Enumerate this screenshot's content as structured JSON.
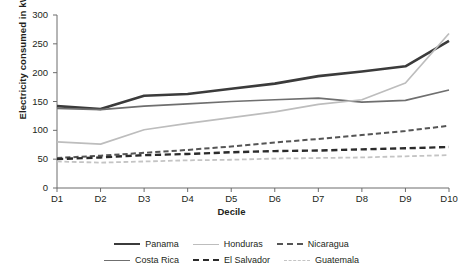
{
  "chart_data": {
    "type": "line",
    "title": "",
    "xlabel": "Decile",
    "ylabel": "Electricity consumed in kWh",
    "categories": [
      "D1",
      "D2",
      "D3",
      "D4",
      "D5",
      "D6",
      "D7",
      "D8",
      "D9",
      "D10"
    ],
    "ylim": [
      0,
      300
    ],
    "yticks": [
      0,
      50,
      100,
      150,
      200,
      250,
      300
    ],
    "grid": false,
    "legend_position": "bottom",
    "series": [
      {
        "name": "Panama",
        "color": "#3b3b3b",
        "style": "solid",
        "width": 2.6,
        "values": [
          142,
          137,
          160,
          163,
          172,
          181,
          194,
          202,
          211,
          255
        ]
      },
      {
        "name": "Costa Rica",
        "color": "#6f6f6f",
        "style": "solid",
        "width": 1.7,
        "values": [
          138,
          136,
          142,
          146,
          150,
          153,
          156,
          149,
          152,
          170
        ]
      },
      {
        "name": "Honduras",
        "color": "#bdbdbd",
        "style": "solid",
        "width": 1.7,
        "values": [
          80,
          76,
          101,
          112,
          122,
          132,
          145,
          153,
          182,
          268
        ]
      },
      {
        "name": "Nicaragua",
        "color": "#555555",
        "style": "dashed",
        "width": 2.0,
        "values": [
          52,
          56,
          61,
          66,
          72,
          79,
          85,
          92,
          99,
          108
        ]
      },
      {
        "name": "El Salvador",
        "color": "#2b2b2b",
        "style": "dashed",
        "width": 2.4,
        "values": [
          50,
          53,
          57,
          59,
          62,
          64,
          65,
          67,
          69,
          71
        ]
      },
      {
        "name": "Guatemala",
        "color": "#c4c4c4",
        "style": "dashed",
        "width": 1.8,
        "values": [
          46,
          44,
          46,
          48,
          49,
          51,
          52,
          53,
          55,
          57
        ]
      }
    ]
  },
  "axis": {
    "y_ticks": [
      "0",
      "50",
      "100",
      "150",
      "200",
      "250",
      "300"
    ],
    "x_ticks": [
      "D1",
      "D2",
      "D3",
      "D4",
      "D5",
      "D6",
      "D7",
      "D8",
      "D9",
      "D10"
    ],
    "x_title": "Decile",
    "y_title": "Electricity consumed in kWh"
  },
  "legend": {
    "rows": [
      [
        {
          "label": "Panama",
          "color": "#3b3b3b",
          "style": "solid",
          "width": 2.6
        },
        {
          "label": "Honduras",
          "color": "#bdbdbd",
          "style": "solid",
          "width": 1.7
        },
        {
          "label": "Nicaragua",
          "color": "#555555",
          "style": "dashed",
          "width": 2.0
        }
      ],
      [
        {
          "label": "Costa Rica",
          "color": "#6f6f6f",
          "style": "solid",
          "width": 1.7
        },
        {
          "label": "El Salvador",
          "color": "#2b2b2b",
          "style": "dashed",
          "width": 2.4
        },
        {
          "label": "Guatemala",
          "color": "#c4c4c4",
          "style": "dashed",
          "width": 1.8
        }
      ]
    ]
  }
}
